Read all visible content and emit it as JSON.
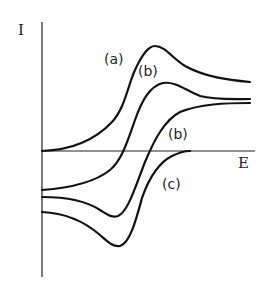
{
  "figure": {
    "axis_labels": {
      "y": "I",
      "x": "E"
    },
    "curve_labels": {
      "a": "(a)",
      "b_upper": "(b)",
      "b_lower": "(b)",
      "c": "(c)"
    },
    "colors": {
      "ink": "#111111",
      "background": "#ffffff"
    }
  }
}
